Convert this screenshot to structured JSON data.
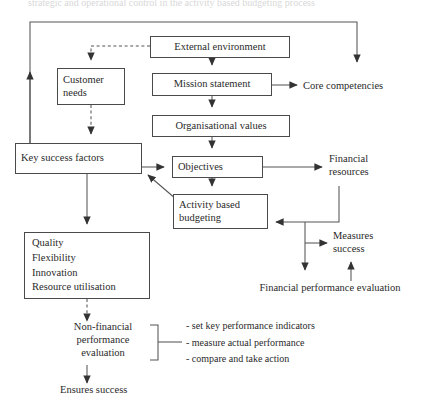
{
  "diagram": {
    "title_fragment": "strategic and operational control in the activity based budgeting process",
    "nodes": {
      "external_environment": "External environment",
      "customer_needs": "Customer\nneeds",
      "mission_statement": "Mission statement",
      "organisational_values": "Organisational values",
      "key_success_factors": "Key success factors",
      "objectives": "Objectives",
      "activity_based_budgeting": "Activity based\nbudgeting",
      "performance_measures": [
        "Quality",
        "Flexibility",
        "Innovation",
        "Resource utilisation"
      ]
    },
    "labels": {
      "core_competencies": "Core competencies",
      "financial_resources": "Financial\nresources",
      "measures_success": "Measures\nsuccess",
      "financial_performance_evaluation": "Financial performance evaluation",
      "non_financial_performance_evaluation": "Non-financial\nperformance\nevaluation",
      "ensures_success": "Ensures success"
    },
    "bullets": [
      "- set key performance indicators",
      "- measure actual performance",
      "- compare and take action"
    ],
    "colors": {
      "line": "#555555",
      "box_border": "#4a4a4a",
      "text": "#2a2a2a",
      "background": "#ffffff"
    }
  }
}
